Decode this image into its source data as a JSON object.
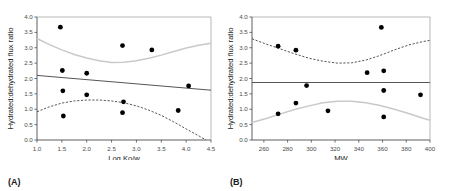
{
  "figure": {
    "panel_a_label": "(A)",
    "panel_b_label": "(B)"
  },
  "chart_data": [
    {
      "type": "scatter",
      "panel": "(A)",
      "title": "",
      "xlabel": "Log Ko/w",
      "ylabel": "Hydrated:dehydrated flux ratio",
      "xlim": [
        1.0,
        4.5
      ],
      "ylim": [
        0.0,
        4.0
      ],
      "xticks": [
        1.0,
        1.5,
        2.0,
        2.5,
        3.0,
        3.5,
        4.0,
        4.5
      ],
      "xticklabels": [
        "1.0",
        "1.5",
        "2.0",
        "2.5",
        "3.0",
        "3.5",
        "4.0",
        "4.5"
      ],
      "yticks": [
        0.0,
        0.5,
        1.0,
        1.5,
        2.0,
        2.5,
        3.0,
        3.5,
        4.0
      ],
      "yticklabels": [
        "0.0",
        "0.5",
        "1.0",
        "1.5",
        "2.0",
        "2.5",
        "3.0",
        "3.5",
        "4.0"
      ],
      "grid": false,
      "legend": "none",
      "points": [
        {
          "x": 1.47,
          "y": 3.67
        },
        {
          "x": 1.51,
          "y": 2.26
        },
        {
          "x": 1.52,
          "y": 1.6
        },
        {
          "x": 1.53,
          "y": 0.78
        },
        {
          "x": 2.0,
          "y": 2.17
        },
        {
          "x": 2.0,
          "y": 1.47
        },
        {
          "x": 2.72,
          "y": 3.07
        },
        {
          "x": 2.74,
          "y": 1.24
        },
        {
          "x": 2.72,
          "y": 0.89
        },
        {
          "x": 3.31,
          "y": 2.93
        },
        {
          "x": 3.84,
          "y": 0.96
        },
        {
          "x": 4.05,
          "y": 1.76
        }
      ],
      "regression_line": {
        "name": "regression",
        "x": [
          1.0,
          4.5
        ],
        "y": [
          2.1,
          1.62
        ],
        "style": "solid",
        "color": "#555555"
      },
      "confidence_curves": [
        {
          "name": "upper-confidence-band",
          "style": "solid",
          "color": "#c9c9c9",
          "x": [
            1.0,
            1.25,
            1.5,
            1.75,
            2.0,
            2.25,
            2.5,
            2.75,
            3.0,
            3.25,
            3.5,
            3.75,
            4.0,
            4.25,
            4.5
          ],
          "y": [
            3.3,
            3.1,
            2.93,
            2.78,
            2.67,
            2.58,
            2.52,
            2.53,
            2.58,
            2.66,
            2.76,
            2.88,
            2.99,
            3.08,
            3.15
          ]
        },
        {
          "name": "lower-confidence-band",
          "style": "dashed",
          "color": "#444444",
          "x": [
            1.0,
            1.25,
            1.5,
            1.75,
            2.0,
            2.25,
            2.5,
            2.75,
            3.0,
            3.25,
            3.5,
            3.75,
            4.0,
            4.25,
            4.4
          ],
          "y": [
            0.92,
            1.08,
            1.2,
            1.27,
            1.3,
            1.3,
            1.27,
            1.21,
            1.11,
            0.97,
            0.8,
            0.59,
            0.36,
            0.14,
            0.0
          ]
        }
      ]
    },
    {
      "type": "scatter",
      "panel": "(B)",
      "title": "",
      "xlabel": "MW",
      "ylabel": "Hydrated:dehydrated flux ratio",
      "xlim": [
        250,
        400
      ],
      "ylim": [
        0.0,
        4.0
      ],
      "xticks": [
        260,
        280,
        300,
        320,
        340,
        360,
        380,
        400
      ],
      "xticklabels": [
        "260",
        "280",
        "300",
        "320",
        "340",
        "360",
        "380",
        "400"
      ],
      "yticks": [
        0.0,
        0.5,
        1.0,
        1.5,
        2.0,
        2.5,
        3.0,
        3.5,
        4.0
      ],
      "yticklabels": [
        "0.0",
        "0.5",
        "1.0",
        "1.5",
        "2.0",
        "2.5",
        "3.0",
        "3.5",
        "4.0"
      ],
      "grid": false,
      "legend": "none",
      "points": [
        {
          "x": 272,
          "y": 3.05
        },
        {
          "x": 272,
          "y": 0.85
        },
        {
          "x": 287,
          "y": 2.92
        },
        {
          "x": 287,
          "y": 1.2
        },
        {
          "x": 296,
          "y": 1.77
        },
        {
          "x": 314,
          "y": 0.95
        },
        {
          "x": 347,
          "y": 2.19
        },
        {
          "x": 359,
          "y": 3.66
        },
        {
          "x": 361,
          "y": 2.25
        },
        {
          "x": 361,
          "y": 1.61
        },
        {
          "x": 361,
          "y": 0.75
        },
        {
          "x": 392,
          "y": 1.47
        }
      ],
      "regression_line": {
        "name": "regression",
        "x": [
          250,
          400
        ],
        "y": [
          1.87,
          1.87
        ],
        "style": "solid",
        "color": "#555555"
      },
      "confidence_curves": [
        {
          "name": "upper-confidence-band",
          "style": "dashed",
          "color": "#444444",
          "x": [
            250,
            262,
            274,
            286,
            298,
            310,
            322,
            334,
            346,
            358,
            370,
            382,
            394,
            400
          ],
          "y": [
            3.29,
            3.12,
            2.96,
            2.8,
            2.66,
            2.56,
            2.5,
            2.51,
            2.6,
            2.75,
            2.93,
            3.09,
            3.2,
            3.24
          ]
        },
        {
          "name": "lower-confidence-band",
          "style": "solid",
          "color": "#c9c9c9",
          "x": [
            250,
            262,
            274,
            286,
            298,
            310,
            322,
            334,
            346,
            358,
            370,
            382,
            394,
            400
          ],
          "y": [
            0.57,
            0.7,
            0.85,
            0.99,
            1.11,
            1.21,
            1.26,
            1.26,
            1.21,
            1.12,
            1.0,
            0.86,
            0.71,
            0.64
          ]
        }
      ]
    }
  ]
}
